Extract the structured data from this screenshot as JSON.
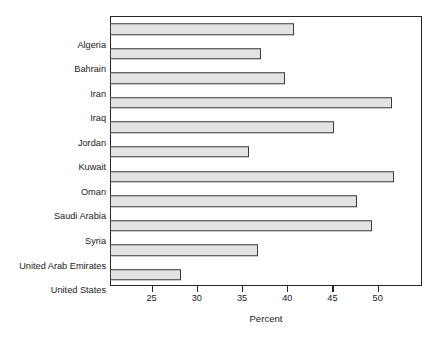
{
  "chart_data": {
    "type": "bar",
    "orientation": "horizontal",
    "title": "",
    "xlabel": "Percent",
    "ylabel": "",
    "categories": [
      "Algeria",
      "Bahrain",
      "Iran",
      "Iraq",
      "Jordan",
      "Kuwait",
      "Oman",
      "Saudi Arabia",
      "Syria",
      "United Arab Emirates",
      "United States"
    ],
    "values": [
      40.6,
      37.0,
      39.6,
      51.5,
      45.1,
      35.7,
      51.7,
      47.6,
      49.3,
      36.6,
      28.1
    ],
    "xlim": [
      20.4,
      54.9
    ],
    "xticks": [
      25,
      30,
      35,
      40,
      45,
      50
    ],
    "xtick_labels": [
      "25",
      "30",
      "35",
      "40",
      "45",
      "50"
    ],
    "grid": false,
    "legend": null,
    "bar_fill_color": "#e3e3e3",
    "bar_edge_color": "#3a3a3a",
    "frame_color": "#262626",
    "background_color": "#ffffff"
  }
}
